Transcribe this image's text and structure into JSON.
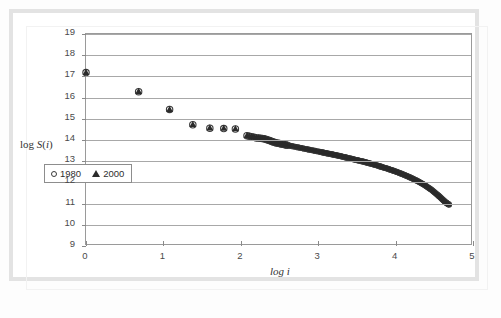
{
  "chart_data": {
    "type": "scatter",
    "title": "",
    "subtitle": "",
    "xlabel": "log i",
    "ylabel": "log S(i)",
    "xlim": [
      0,
      5
    ],
    "ylim": [
      9,
      19
    ],
    "xticks": [
      0,
      1,
      2,
      3,
      4,
      5
    ],
    "yticks": [
      9,
      10,
      11,
      12,
      13,
      14,
      15,
      16,
      17,
      18,
      19
    ],
    "grid": "horizontal",
    "legend_position": "inside-lower-left",
    "legend": [
      {
        "label": "1980",
        "marker": "open-circle"
      },
      {
        "label": "2000",
        "marker": "filled-triangle"
      }
    ],
    "series": [
      {
        "name": "1980",
        "marker": "open-circle",
        "points": [
          [
            0.0,
            17.18
          ],
          [
            0.68,
            16.28
          ],
          [
            1.08,
            15.44
          ],
          [
            1.38,
            14.72
          ],
          [
            1.6,
            14.56
          ],
          [
            1.78,
            14.54
          ],
          [
            1.93,
            14.52
          ],
          [
            2.08,
            14.2
          ],
          [
            2.2,
            14.1
          ],
          [
            2.3,
            14.06
          ],
          [
            2.38,
            13.96
          ],
          [
            2.46,
            13.86
          ],
          [
            2.54,
            13.8
          ],
          [
            2.62,
            13.74
          ],
          [
            2.7,
            13.68
          ],
          [
            2.78,
            13.62
          ],
          [
            2.86,
            13.56
          ],
          [
            2.94,
            13.5
          ],
          [
            3.02,
            13.44
          ],
          [
            3.1,
            13.38
          ],
          [
            3.18,
            13.32
          ],
          [
            3.26,
            13.26
          ],
          [
            3.34,
            13.19
          ],
          [
            3.42,
            13.12
          ],
          [
            3.5,
            13.05
          ],
          [
            3.58,
            12.98
          ],
          [
            3.66,
            12.9
          ],
          [
            3.74,
            12.82
          ],
          [
            3.82,
            12.73
          ],
          [
            3.9,
            12.64
          ],
          [
            3.98,
            12.54
          ],
          [
            4.06,
            12.43
          ],
          [
            4.14,
            12.31
          ],
          [
            4.22,
            12.18
          ],
          [
            4.3,
            12.03
          ],
          [
            4.38,
            11.86
          ],
          [
            4.46,
            11.66
          ],
          [
            4.54,
            11.42
          ],
          [
            4.6,
            11.22
          ],
          [
            4.65,
            11.05
          ],
          [
            4.69,
            10.95
          ]
        ]
      },
      {
        "name": "2000",
        "marker": "filled-triangle",
        "points": [
          [
            0.0,
            17.2
          ],
          [
            0.68,
            16.3
          ],
          [
            1.08,
            15.45
          ],
          [
            1.38,
            14.74
          ],
          [
            1.6,
            14.58
          ],
          [
            1.78,
            14.56
          ],
          [
            1.93,
            14.54
          ],
          [
            2.08,
            14.22
          ],
          [
            2.2,
            14.12
          ],
          [
            2.3,
            14.08
          ],
          [
            2.38,
            13.98
          ],
          [
            2.46,
            13.88
          ],
          [
            2.54,
            13.82
          ],
          [
            2.62,
            13.76
          ],
          [
            2.7,
            13.7
          ],
          [
            2.78,
            13.64
          ],
          [
            2.86,
            13.58
          ],
          [
            2.94,
            13.52
          ],
          [
            3.02,
            13.46
          ],
          [
            3.1,
            13.4
          ],
          [
            3.18,
            13.34
          ],
          [
            3.26,
            13.28
          ],
          [
            3.34,
            13.21
          ],
          [
            3.42,
            13.14
          ],
          [
            3.5,
            13.07
          ],
          [
            3.58,
            13.0
          ],
          [
            3.66,
            12.92
          ],
          [
            3.74,
            12.84
          ],
          [
            3.82,
            12.75
          ],
          [
            3.9,
            12.66
          ],
          [
            3.98,
            12.56
          ],
          [
            4.06,
            12.45
          ],
          [
            4.14,
            12.33
          ],
          [
            4.22,
            12.2
          ],
          [
            4.3,
            12.05
          ],
          [
            4.38,
            11.88
          ],
          [
            4.46,
            11.68
          ],
          [
            4.54,
            11.44
          ],
          [
            4.6,
            11.24
          ],
          [
            4.65,
            11.07
          ],
          [
            4.69,
            10.97
          ]
        ]
      }
    ],
    "colors": {
      "marker_1980": "#3a3a3a",
      "marker_2000": "#2b2b2b",
      "gridline": "#a8a8a8",
      "axis": "#9a9a9a",
      "frame": "#e3e3e3"
    }
  }
}
